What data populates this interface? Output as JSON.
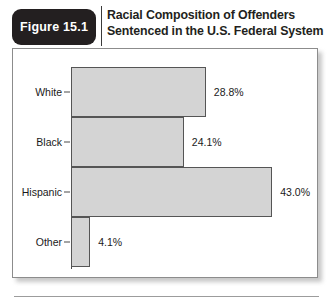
{
  "figure": {
    "badge_label": "Figure 15.1",
    "title_line_1": "Racial Composition of Offenders",
    "title_line_2": "Sentenced in the U.S. Federal System"
  },
  "colors": {
    "badge_background": "#231f20",
    "bar_fill": "#d4d4d4",
    "bar_border": "#555555",
    "panel_border": "#8c8c8c",
    "text": "#1a1a1a"
  },
  "chart_data": {
    "type": "bar",
    "orientation": "horizontal",
    "title": "Racial Composition of Offenders Sentenced in the U.S. Federal System",
    "xlabel": "",
    "ylabel": "",
    "grid": false,
    "legend": false,
    "xlim": [
      0,
      47
    ],
    "categories": [
      "White",
      "Black",
      "Hispanic",
      "Other"
    ],
    "values": [
      28.8,
      24.1,
      43.0,
      4.1
    ],
    "value_labels": [
      "28.8%",
      "24.1%",
      "43.0%",
      "4.1%"
    ],
    "bars": [
      {
        "category": "White",
        "value": 28.8,
        "label": "28.8%"
      },
      {
        "category": "Black",
        "value": 24.1,
        "label": "24.1%"
      },
      {
        "category": "Hispanic",
        "value": 43.0,
        "label": "43.0%"
      },
      {
        "category": "Other",
        "value": 4.1,
        "label": "4.1%"
      }
    ]
  }
}
